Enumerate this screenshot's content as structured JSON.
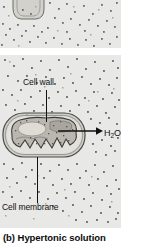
{
  "figure": {
    "caption": "(b) Hypertonic solution",
    "panels": [
      {
        "id": "panel-top",
        "name": "upper-panel-cropped",
        "description_visible": false
      },
      {
        "id": "panel-bottom",
        "name": "hypertonic-panel",
        "description_visible": false
      }
    ]
  },
  "labels": {
    "cell_wall": "Cell wall",
    "cell_membrane": "Cell membrane",
    "water": "H",
    "water_sub": "2",
    "water_tail": "O"
  },
  "colors": {
    "panel_background": "#e8e8e6",
    "solute_dot": "#6e6e70",
    "solute_dot_light": "#9a9a9c",
    "cell_wall_stroke": "#4a4a48",
    "cell_wall_fill": "#c9c9c4",
    "cytoplasm_fill": "#b8b6ae",
    "vacuole_fill": "#dcdad2",
    "membrane_stroke": "#3c3c3a",
    "gap_fill": "#e0dfdb",
    "label_text": "#111111",
    "caption_text": "#0b0b0b",
    "leader_line": "#111111",
    "arrow": "#101010"
  },
  "icons": {
    "water_arrow": "arrow-right-icon",
    "cell_wall_leader": "leader-line-icon",
    "cell_membrane_leader": "leader-line-icon"
  }
}
